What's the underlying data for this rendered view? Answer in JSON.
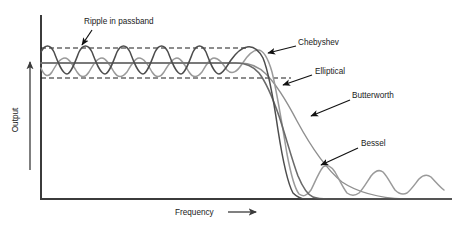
{
  "chart_data": {
    "type": "line",
    "title": "",
    "xlabel": "Frequency",
    "ylabel": "Output",
    "xlabel_arrow": "⟶",
    "ylabel_arrow": "⟶",
    "grid": false,
    "legend_position": "inline-annotations",
    "xlim": [
      0,
      1
    ],
    "ylim": [
      0,
      1
    ],
    "axis_ticks": [],
    "annotations": [
      {
        "id": "ripple-in-passband",
        "text": "Ripple in passband",
        "text_x": 84,
        "text_y": 24,
        "leader_from_x": 92,
        "leader_from_y": 30,
        "leader_to_x": 82,
        "leader_to_y": 45,
        "arrow_at": "end"
      },
      {
        "id": "chebyshev",
        "text": "Chebyshev",
        "text_x": 298,
        "text_y": 45,
        "leader_from_x": 296,
        "leader_from_y": 46,
        "leader_to_x": 268,
        "leader_to_y": 53,
        "arrow_at": "end"
      },
      {
        "id": "elliptical",
        "text": "Elliptical",
        "text_x": 315,
        "text_y": 74,
        "leader_from_x": 312,
        "leader_from_y": 75,
        "leader_to_x": 283,
        "leader_to_y": 85,
        "arrow_at": "end"
      },
      {
        "id": "butterworth",
        "text": "Butterworth",
        "text_x": 352,
        "text_y": 98,
        "leader_from_x": 350,
        "leader_from_y": 100,
        "leader_to_x": 311,
        "leader_to_y": 116,
        "arrow_at": "end"
      },
      {
        "id": "bessel",
        "text": "Bessel",
        "text_x": 361,
        "text_y": 146,
        "leader_from_x": 358,
        "leader_from_y": 148,
        "leader_to_x": 321,
        "leader_to_y": 165,
        "arrow_at": "end"
      }
    ],
    "reference_lines": [
      {
        "id": "ripple-upper-bound",
        "style": "dashed",
        "y": 48,
        "x_start": 41,
        "x_end": 246
      },
      {
        "id": "ripple-lower-bound",
        "style": "dashed",
        "y": 78,
        "x_start": 41,
        "x_end": 291
      }
    ],
    "series": [
      {
        "name": "Chebyshev",
        "color": "#4d4d4d",
        "width": 1.5,
        "description": "Equiripple passband with steep rolloff and monotonic stopband",
        "path": "M41,52 C45,44 50,44 54,52 C58,62 62,74 67,74 C71,74 75,62 79,52 C83,44 88,44 92,52 C96,62 100,74 105,74 C109,74 113,62 117,52 C121,44 126,44 130,52 C134,62 138,74 143,74 C147,74 151,62 155,52 C159,44 164,44 168,52 C172,62 176,74 181,74 C185,74 189,62 193,52 C197,44 202,44 206,52 C210,62 214,74 219,74 C223,74 227,66 231,60 C236,53 241,48 247,47 C252,46 258,49 263,58 C268,70 273,96 278,130 C283,162 288,184 293,193 C297,197 301,199 306,199 L452,199"
      },
      {
        "name": "Elliptical",
        "color": "#9a9a9a",
        "width": 1.5,
        "description": "Equiripple in both passband and stopband, steepest rolloff",
        "path": "M41,68 C44,76 48,78 52,72 C56,65 60,58 65,58 C69,58 73,65 77,72 C81,78 85,78 89,72 C93,65 97,58 102,58 C106,58 110,65 114,72 C118,78 122,78 127,72 C131,65 135,58 139,58 C144,58 148,65 152,72 C156,78 160,78 164,72 C168,65 173,58 177,58 C181,58 185,65 189,72 C193,78 197,78 202,72 C206,65 210,58 214,58 C219,58 223,64 227,70 C232,75 237,72 242,64 C247,56 252,50 258,50 C263,50 268,58 272,72 C277,92 282,124 287,154 C291,175 295,189 299,194 C303,197 307,196 311,190 C315,182 319,172 323,167 C327,164 331,166 335,172 C339,179 343,188 347,193 C351,196 355,196 359,193 C363,189 367,182 371,176 C375,171 379,169 383,172 C387,176 391,184 395,190 C399,194 403,195 407,193 C411,190 415,184 419,179 C423,175 427,174 431,177 C435,181 439,186 444,190"
      },
      {
        "name": "Butterworth",
        "color": "#8f8f8f",
        "width": 1.4,
        "description": "Maximally flat passband with gentle gradual rolloff",
        "path": "M41,63 L240,63 C250,63 258,66 266,74 C276,84 286,100 297,121 C310,145 325,168 342,182 C360,194 382,198 404,199 L452,199"
      },
      {
        "name": "Bessel",
        "color": "#6a6a6a",
        "width": 1.6,
        "description": "Flat passband with linear phase and moderate rolloff",
        "path": "M41,63 L236,63 C246,63 253,66 259,73 C266,82 272,96 279,116 C286,137 292,160 298,176 C303,188 308,195 313,197 C318,199 323,199 329,199 L452,199"
      }
    ],
    "axes": {
      "y_axis": {
        "x": 41,
        "y_top": 16,
        "y_bottom": 199
      },
      "x_axis": {
        "y": 199,
        "x_start": 41,
        "x_end": 452
      },
      "y_arrow": {
        "x": 30,
        "y_top": 62,
        "y_bottom": 170
      },
      "x_arrow": {
        "y": 212,
        "x_start": 228,
        "x_end": 256
      }
    }
  },
  "labels": {
    "ylabel": "Output",
    "xlabel": "Frequency",
    "ripple": "Ripple in passband",
    "chebyshev": "Chebyshev",
    "elliptical": "Elliptical",
    "butterworth": "Butterworth",
    "bessel": "Bessel"
  },
  "colors": {
    "background": "#ffffff",
    "axis": "#3b3b3b",
    "text": "#1a1a1a",
    "dashed": "#1d1d1d",
    "chebyshev": "#4d4d4d",
    "elliptical": "#9a9a9a",
    "butterworth": "#8f8f8f",
    "bessel": "#6a6a6a"
  }
}
